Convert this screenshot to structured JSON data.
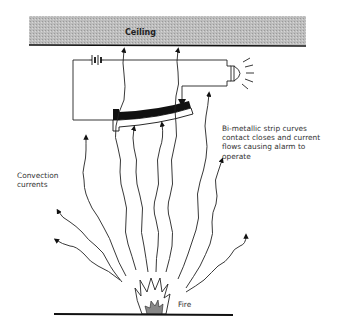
{
  "labels": {
    "ceiling": "Ceiling",
    "description": [
      "Bi-metallic strip curves",
      "contact closes and current",
      "flows causing alarm to",
      "operate"
    ],
    "convection": [
      "Convection",
      "currents"
    ],
    "fire": "Fire"
  },
  "components": [
    "ceiling",
    "battery",
    "alarm-bell",
    "contact-arrow",
    "bi-metallic-strip",
    "convection-current-arrows",
    "fire",
    "floor"
  ],
  "colors": {
    "ceiling_fill": "#b8b8b8",
    "line": "#111111",
    "strip_dark": "#111111",
    "flame_core": "#888888"
  }
}
